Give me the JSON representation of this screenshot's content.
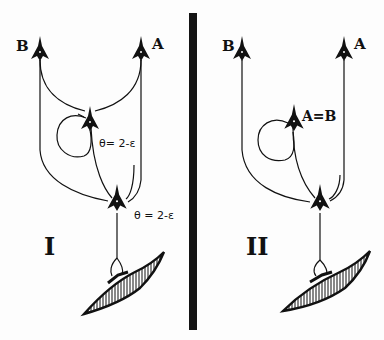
{
  "colors": {
    "ink": "#111111",
    "background": "#fdfdfd",
    "divider": "#141414"
  },
  "panels": [
    {
      "id": "I",
      "roman_label": "I",
      "input_neurons": [
        {
          "label": "B"
        },
        {
          "label": "A"
        }
      ],
      "interneuron": {
        "threshold_label": "θ= 2-ε"
      },
      "motor_neuron": {
        "threshold_label": "θ = 2-ε"
      },
      "muscle": "muscle-fiber"
    },
    {
      "id": "II",
      "roman_label": "II",
      "input_neurons": [
        {
          "label": "B"
        },
        {
          "label": "A"
        }
      ],
      "interneuron": {
        "label": "A=B"
      },
      "motor_neuron": {},
      "muscle": "muscle-fiber"
    }
  ]
}
